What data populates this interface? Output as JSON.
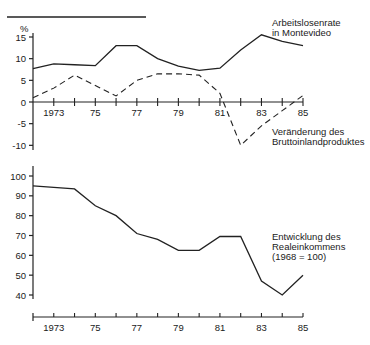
{
  "chart_data": [
    {
      "type": "line",
      "title": "",
      "ylabel": "%",
      "xlabel": "",
      "ylim": [
        -10,
        15
      ],
      "yticks": [
        15,
        10,
        5,
        0,
        -5,
        -10
      ],
      "x": [
        1972,
        1973,
        1974,
        1975,
        1976,
        1977,
        1978,
        1979,
        1980,
        1981,
        1982,
        1983,
        1984,
        1985
      ],
      "xtick_labels": [
        "1973",
        "75",
        "77",
        "79",
        "81",
        "83",
        "85"
      ],
      "series": [
        {
          "name": "Arbeitslosenrate in Montevideo",
          "style": "solid",
          "values": [
            7.7,
            8.8,
            8.6,
            8.4,
            13.0,
            13.0,
            10.0,
            8.3,
            7.3,
            7.8,
            12.0,
            15.5,
            14.0,
            13.0
          ]
        },
        {
          "name": "Veränderung des Bruttoinlandproduktes",
          "style": "dashed",
          "values": [
            1.0,
            3.2,
            6.2,
            3.8,
            1.4,
            5.0,
            6.5,
            6.5,
            6.2,
            2.0,
            -10.0,
            -5.5,
            -2.0,
            1.5
          ]
        }
      ],
      "annotations": [
        "Arbeitslosenrate",
        "in Montevideo",
        "Veränderung des",
        "Bruttoinlandproduktes"
      ],
      "grid": false
    },
    {
      "type": "line",
      "title": "",
      "ylabel": "",
      "xlabel": "",
      "ylim": [
        40,
        100
      ],
      "yticks": [
        100,
        90,
        80,
        70,
        60,
        50,
        40
      ],
      "x": [
        1972,
        1973,
        1974,
        1975,
        1976,
        1977,
        1978,
        1979,
        1980,
        1981,
        1982,
        1983,
        1984,
        1985
      ],
      "xtick_labels": [
        "1973",
        "75",
        "77",
        "79",
        "81",
        "83",
        "85"
      ],
      "series": [
        {
          "name": "Entwicklung des Realeinkommens (1968 = 100)",
          "style": "solid",
          "values": [
            95.0,
            94.3,
            93.5,
            85.0,
            80.0,
            71.0,
            68.0,
            62.5,
            62.5,
            69.5,
            69.5,
            47.0,
            40.0,
            50.0
          ]
        }
      ],
      "annotations": [
        "Entwicklung des",
        "Realeinkommens",
        "(1968 = 100)"
      ],
      "grid": false
    }
  ],
  "labels": {
    "top_unit": "%",
    "top_yticks": [
      "15",
      "10",
      "5",
      "0",
      "-5",
      "-10"
    ],
    "bottom_yticks": [
      "100",
      "90",
      "80",
      "70",
      "60",
      "50",
      "40"
    ],
    "xticks": [
      "1973",
      "75",
      "77",
      "79",
      "81",
      "83",
      "85"
    ],
    "unemployment_line1": "Arbeitslosenrate",
    "unemployment_line2": "in Montevideo",
    "gdp_line1": "Veränderung des",
    "gdp_line2": "Bruttoinlandproduktes",
    "income_line1": "Entwicklung des",
    "income_line2": "Realeinkommens",
    "income_line3": "(1968 = 100)"
  }
}
